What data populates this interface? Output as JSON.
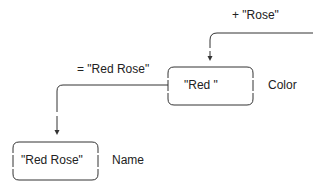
{
  "diagram": {
    "top_operation": "+ \"Rose\"",
    "middle_operation": "= \"Red Rose\"",
    "nodes": [
      {
        "value": "\"Red \"",
        "label": "Color"
      },
      {
        "value": "\"Red Rose\"",
        "label": "Name"
      }
    ]
  }
}
